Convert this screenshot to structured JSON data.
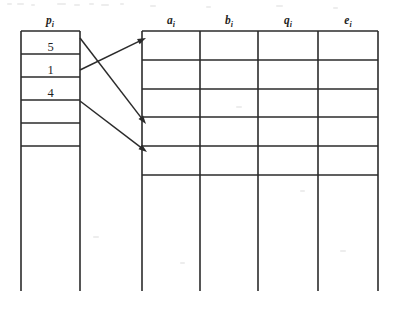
{
  "diagram": {
    "type": "two-table-pointer-diagram",
    "background_color": "#ffffff",
    "line_color": "#2b2b2b",
    "text_color": "#1f1f1f",
    "width": 395,
    "height": 311
  },
  "left_table": {
    "header": {
      "base": "p",
      "subscript": "i",
      "text": "pᵢ"
    },
    "header_x": 50,
    "header_y": 24,
    "left_x": 21,
    "right_x": 80,
    "top_y": 31,
    "row_line_ys": [
      31,
      54,
      77,
      100,
      123,
      146
    ],
    "stem_bottom_y": 291,
    "rows": [
      {
        "index": 0,
        "value": "5",
        "center_y": 46
      },
      {
        "index": 1,
        "value": "1",
        "center_y": 69
      },
      {
        "index": 2,
        "value": "4",
        "center_y": 92
      },
      {
        "index": 3,
        "value": "",
        "center_y": 115
      },
      {
        "index": 4,
        "value": "",
        "center_y": 138
      }
    ]
  },
  "right_table": {
    "headers": [
      {
        "base": "a",
        "subscript": "i",
        "text": "aᵢ",
        "center_x": 171
      },
      {
        "base": "b",
        "subscript": "i",
        "text": "bᵢ",
        "center_x": 229
      },
      {
        "base": "q",
        "subscript": "i",
        "text": "qᵢ",
        "center_x": 288
      },
      {
        "base": "e",
        "subscript": "i",
        "text": "eᵢ",
        "center_x": 348
      }
    ],
    "header_y": 24,
    "column_xs": [
      142,
      200,
      258,
      318,
      378
    ],
    "left_x": 142,
    "right_x": 378,
    "top_y": 31,
    "row_line_ys": [
      31,
      60,
      89,
      117,
      146,
      175
    ],
    "stem_bottom_y": 291,
    "rows": [
      {
        "index": 0,
        "cells": [
          "",
          "",
          "",
          ""
        ]
      },
      {
        "index": 1,
        "cells": [
          "",
          "",
          "",
          ""
        ]
      },
      {
        "index": 2,
        "cells": [
          "",
          "",
          "",
          ""
        ]
      },
      {
        "index": 3,
        "cells": [
          "",
          "",
          "",
          ""
        ]
      },
      {
        "index": 4,
        "cells": [
          "",
          "",
          "",
          ""
        ]
      }
    ]
  },
  "arrows": [
    {
      "id": "arrow-1",
      "from_row": 1,
      "to_row": 0,
      "x1": 80,
      "y1": 70,
      "x2": 146,
      "y2": 38
    },
    {
      "id": "arrow-2",
      "from_row": 0,
      "to_row": 3,
      "x1": 80,
      "y1": 38,
      "x2": 146,
      "y2": 124
    },
    {
      "id": "arrow-3",
      "from_row": 2,
      "to_row": 4,
      "x1": 80,
      "y1": 101,
      "x2": 147,
      "y2": 152
    }
  ],
  "specks": [
    {
      "x": 7,
      "y": 3,
      "w": 5,
      "h": 2
    },
    {
      "x": 17,
      "y": 3,
      "w": 7,
      "h": 2
    },
    {
      "x": 31,
      "y": 4,
      "w": 4,
      "h": 2
    },
    {
      "x": 57,
      "y": 3,
      "w": 9,
      "h": 2
    },
    {
      "x": 74,
      "y": 4,
      "w": 6,
      "h": 2
    },
    {
      "x": 89,
      "y": 3,
      "w": 5,
      "h": 2
    },
    {
      "x": 101,
      "y": 4,
      "w": 8,
      "h": 2
    },
    {
      "x": 120,
      "y": 3,
      "w": 4,
      "h": 2
    },
    {
      "x": 150,
      "y": 5,
      "w": 6,
      "h": 2
    },
    {
      "x": 206,
      "y": 6,
      "w": 5,
      "h": 2
    },
    {
      "x": 276,
      "y": 5,
      "w": 7,
      "h": 2
    },
    {
      "x": 333,
      "y": 7,
      "w": 5,
      "h": 2
    },
    {
      "x": 236,
      "y": 106,
      "w": 6,
      "h": 2
    },
    {
      "x": 300,
      "y": 190,
      "w": 5,
      "h": 2
    },
    {
      "x": 93,
      "y": 236,
      "w": 6,
      "h": 2
    },
    {
      "x": 180,
      "y": 262,
      "w": 5,
      "h": 2
    },
    {
      "x": 340,
      "y": 250,
      "w": 6,
      "h": 2
    }
  ]
}
